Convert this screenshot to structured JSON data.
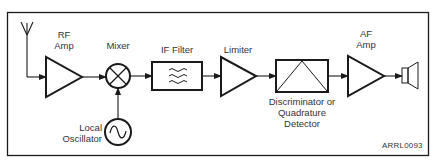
{
  "diagram": {
    "blocks": [
      {
        "id": "antenna",
        "label": ""
      },
      {
        "id": "rf-amp",
        "label_line1": "RF",
        "label_line2": "Amp"
      },
      {
        "id": "mixer",
        "label": "Mixer"
      },
      {
        "id": "local-oscillator",
        "label_line1": "Local",
        "label_line2": "Oscillator"
      },
      {
        "id": "if-filter",
        "label": "IF Filter"
      },
      {
        "id": "limiter",
        "label": "Limiter"
      },
      {
        "id": "discriminator",
        "label_line1": "Discriminator or",
        "label_line2": "Quadrature",
        "label_line3": "Detector"
      },
      {
        "id": "af-amp",
        "label_line1": "AF",
        "label_line2": "Amp"
      },
      {
        "id": "speaker",
        "label": ""
      }
    ],
    "credit": "ARRL0093",
    "colors": {
      "line": "#1a1a1a",
      "text": "#333333",
      "background": "#ffffff"
    }
  }
}
